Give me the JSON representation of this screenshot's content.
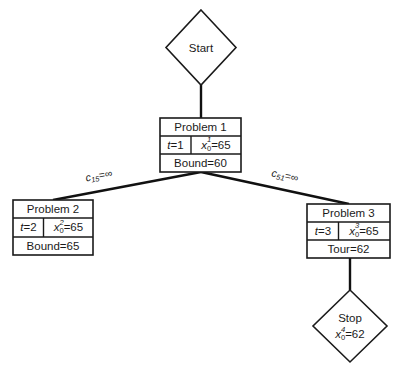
{
  "diagram": {
    "kind": "branch-and-bound-tree",
    "background_color": "#ffffff",
    "line_color": "#111111",
    "text_color": "#1a1a1a",
    "start": {
      "label": "Start"
    },
    "stop": {
      "label": "Stop",
      "value_var": "x",
      "value_sub": "0",
      "value_sup": "4",
      "value_eq": "=62"
    },
    "problem1": {
      "title": "Problem 1",
      "t_var": "t",
      "t_value": "=1",
      "x_var": "x",
      "x_sub": "0",
      "x_sup": "1",
      "x_value": "=65",
      "footer": "Bound=60"
    },
    "problem2": {
      "title": "Problem 2",
      "t_var": "t",
      "t_value": "=2",
      "x_var": "x",
      "x_sub": "0",
      "x_sup": "2",
      "x_value": "=65",
      "footer": "Bound=65"
    },
    "problem3": {
      "title": "Problem 3",
      "t_var": "t",
      "t_value": "=3",
      "x_var": "x",
      "x_sub": "0",
      "x_sup": "3",
      "x_value": "=65",
      "footer": "Tour=62"
    },
    "edge_left": {
      "var": "c",
      "sub": "15",
      "rest": "=∞"
    },
    "edge_right": {
      "var": "c",
      "sub": "51",
      "rest": "=∞"
    }
  }
}
